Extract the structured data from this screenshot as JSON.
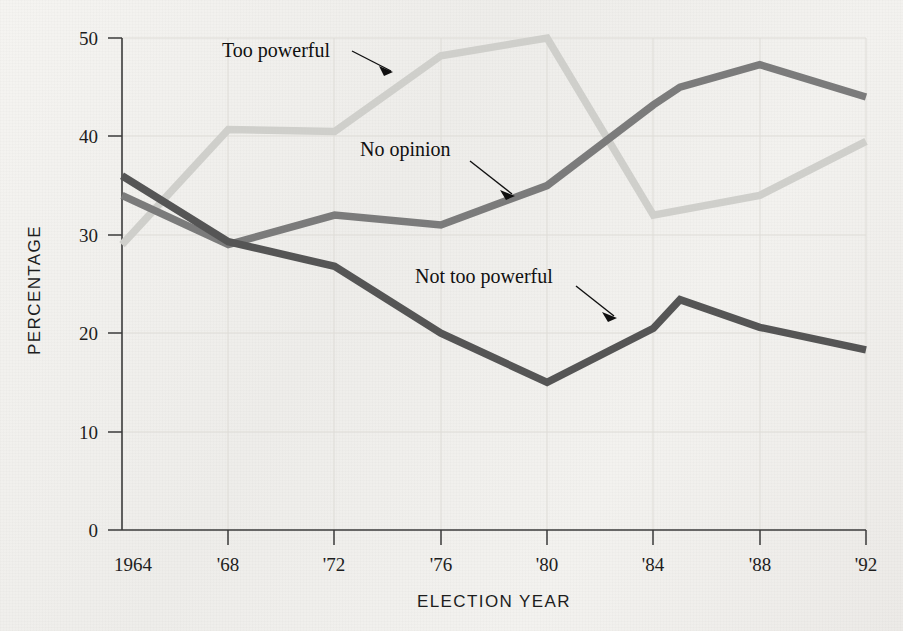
{
  "chart_data": {
    "type": "line",
    "title": "",
    "xlabel": "ELECTION YEAR",
    "ylabel": "PERCENTAGE",
    "categories": [
      "1964",
      "'68",
      "'72",
      "'76",
      "'80",
      "'84",
      "'88",
      "'92"
    ],
    "x": [
      1964,
      1968,
      1972,
      1976,
      1980,
      1984,
      1988,
      1992
    ],
    "xlim": [
      1964,
      1992
    ],
    "ylim": [
      0,
      50
    ],
    "yticks": [
      0,
      10,
      20,
      30,
      40,
      50
    ],
    "ytick_labels": [
      "0",
      "10",
      "20",
      "30",
      "40",
      "50"
    ],
    "grid": true,
    "legend": "annotations-with-arrows",
    "series": [
      {
        "name": "Too powerful",
        "color": "#cfcfcb",
        "values": [
          29,
          40.7,
          40.5,
          48.2,
          50,
          32,
          34,
          39.5
        ]
      },
      {
        "name": "No opinion",
        "color": "#7b7b7b",
        "values": [
          34,
          29,
          32,
          31,
          35,
          45,
          47.3,
          44
        ]
      },
      {
        "name": "Not too powerful",
        "color": "#555555",
        "values": [
          36,
          29.3,
          26.8,
          20,
          15,
          23.4,
          20.6,
          18.3
        ]
      }
    ],
    "annotations": [
      {
        "text": "Too powerful",
        "target_series": "Too powerful"
      },
      {
        "text": "No opinion",
        "target_series": "No opinion"
      },
      {
        "text": "Not too powerful",
        "target_series": "Not too powerful"
      }
    ],
    "colors": {
      "background": "#f2f1ee",
      "axis": "#3a3a3a",
      "grid": "#dedcd7",
      "text": "#1d1d1d"
    }
  }
}
